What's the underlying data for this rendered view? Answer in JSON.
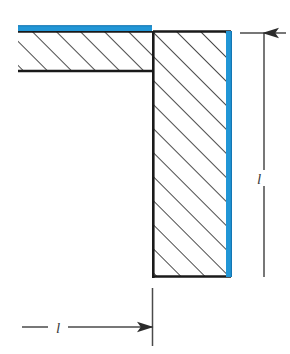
{
  "figure": {
    "type": "technical-cross-section",
    "background": "#ffffff"
  },
  "colors": {
    "outline": "#1a1a1a",
    "hatch": "#2b2b2b",
    "highlight_blue": "#2196d6",
    "highlight_blue_dark": "#1173b0",
    "dimension_line": "#4a4a4a",
    "label_text": "#3b3b3b",
    "fill": "#ffffff"
  },
  "geometry": {
    "horizontal_arm": {
      "name": "horizontal-flange",
      "x": 18,
      "y": 31,
      "width": 134,
      "height": 41,
      "open_left_edge": true
    },
    "vertical_arm": {
      "name": "vertical-web",
      "x": 152,
      "y": 31,
      "width": 79,
      "height": 246
    },
    "blue_strip_top": {
      "x": 18,
      "y": 26,
      "width": 134,
      "height": 5
    },
    "blue_strip_right": {
      "x": 226,
      "y": 31,
      "width": 6,
      "height": 246
    },
    "hatch_spacing": 17,
    "hatch_angle_deg": 45
  },
  "dimensions": {
    "vertical": {
      "name": "height-dimension",
      "label": "l",
      "line_x": 264,
      "y_top": 33,
      "y_bottom": 277,
      "extension_top_y": 33,
      "extension_bottom_y": 277,
      "arrow_direction": "up",
      "label_x": 264,
      "label_y": 178
    },
    "horizontal": {
      "name": "width-dimension",
      "label": "l",
      "line_y": 327,
      "x_left": 22,
      "x_right": 152,
      "extension_x": 152,
      "extension_y_top": 288,
      "extension_y_bottom": 345,
      "arrow_direction": "right",
      "label_x": 58,
      "label_y": 331
    }
  },
  "labels": {
    "vertical_dimension": "l",
    "horizontal_dimension": "l"
  }
}
